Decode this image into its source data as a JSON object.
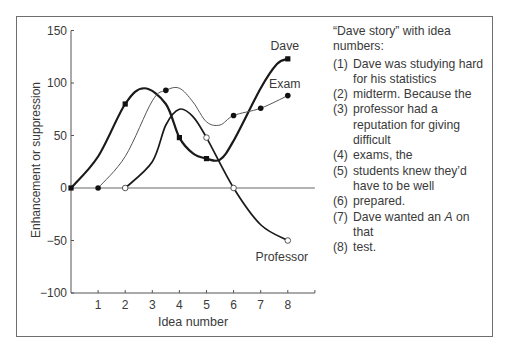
{
  "chart_data": {
    "type": "line",
    "title": "",
    "xlabel": "Idea number",
    "ylabel": "Enhancement or suppression",
    "xlim": [
      0,
      9
    ],
    "ylim": [
      -100,
      150
    ],
    "x_ticks": [
      1,
      2,
      3,
      4,
      5,
      6,
      7,
      8
    ],
    "y_ticks": [
      150,
      100,
      50,
      0,
      -50,
      -100
    ],
    "y_tick_labels": [
      "150",
      "100",
      "50",
      "0",
      "−50",
      "−100"
    ],
    "grid": false,
    "reference_line": {
      "y": 0,
      "color": "#9a9a9a"
    },
    "series": [
      {
        "name": "Dave",
        "marker": "filled-square",
        "line_weight": "thick",
        "points": [
          [
            0,
            0
          ],
          [
            2,
            80
          ],
          [
            4,
            48
          ],
          [
            5,
            28
          ],
          [
            8,
            123
          ]
        ],
        "curve": [
          [
            0,
            0
          ],
          [
            1,
            30
          ],
          [
            2,
            80
          ],
          [
            2.7,
            95
          ],
          [
            3.5,
            80
          ],
          [
            4,
            48
          ],
          [
            4.5,
            33
          ],
          [
            5,
            28
          ],
          [
            5.5,
            27
          ],
          [
            6,
            45
          ],
          [
            7,
            95
          ],
          [
            7.6,
            118
          ],
          [
            8,
            123
          ]
        ]
      },
      {
        "name": "Exam",
        "marker": "filled-circle",
        "line_weight": "thin",
        "points": [
          [
            1,
            0
          ],
          [
            3.5,
            93
          ],
          [
            6,
            69
          ],
          [
            7,
            76
          ],
          [
            8,
            88
          ]
        ],
        "curve": [
          [
            1,
            0
          ],
          [
            2,
            30
          ],
          [
            3,
            83
          ],
          [
            3.5,
            93
          ],
          [
            4,
            95
          ],
          [
            4.5,
            82
          ],
          [
            5,
            63
          ],
          [
            5.5,
            60
          ],
          [
            6,
            69
          ],
          [
            7,
            76
          ],
          [
            8,
            88
          ]
        ]
      },
      {
        "name": "Professor",
        "marker": "open-circle",
        "line_weight": "medium",
        "points": [
          [
            2,
            0
          ],
          [
            5,
            48
          ],
          [
            6,
            0
          ],
          [
            8,
            -50
          ]
        ],
        "curve": [
          [
            2,
            0
          ],
          [
            3,
            25
          ],
          [
            3.5,
            60
          ],
          [
            4,
            75
          ],
          [
            4.5,
            68
          ],
          [
            5,
            48
          ],
          [
            6,
            0
          ],
          [
            7,
            -35
          ],
          [
            8,
            -50
          ]
        ]
      }
    ],
    "series_labels": [
      {
        "name": "Dave",
        "x": 8,
        "y": 135
      },
      {
        "name": "Exam",
        "x": 8,
        "y": 99
      },
      {
        "name": "Professor",
        "x": 8,
        "y": -66
      }
    ]
  },
  "legend": {
    "title": "“Dave story” with idea numbers:",
    "items": [
      {
        "num": "(1)",
        "text": "Dave was studying hard for his statistics"
      },
      {
        "num": "(2)",
        "text": "midterm. Because the"
      },
      {
        "num": "(3)",
        "text": "professor had a reputation for giving difficult"
      },
      {
        "num": "(4)",
        "text": "exams, the"
      },
      {
        "num": "(5)",
        "text": "students knew they’d have to be well"
      },
      {
        "num": "(6)",
        "text": "prepared."
      },
      {
        "num": "(7)",
        "text_before": "Dave wanted an ",
        "italic": "A",
        "text_after": " on that"
      },
      {
        "num": "(8)",
        "text": "test."
      }
    ]
  },
  "colors": {
    "axis": "#555555",
    "zero_line": "#9a9a9a",
    "dave": "#1a1a1a",
    "exam": "#555555",
    "professor": "#1a1a1a",
    "text": "#3a3a3a",
    "frame": "#6e6e6e"
  }
}
